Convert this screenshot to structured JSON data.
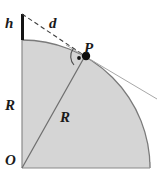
{
  "figure": {
    "background_color": "#ffffff",
    "shade_fill": "#d5d5d5",
    "shade_stroke": "#8c8c8c",
    "line_color": "#6b6b6b",
    "dash_color": "#4a4a4a",
    "accent_color": "#111111",
    "labels": {
      "height": "h",
      "tangent_distance": "d",
      "tangent_point": "P",
      "radius_vertical": "R",
      "radius_diagonal": "R",
      "origin": "O"
    },
    "geometry": {
      "origin_px": [
        22,
        168
      ],
      "radius_px": 128,
      "top_of_circle_px": [
        22,
        40
      ],
      "top_of_height_segment_px": [
        22,
        14
      ],
      "height_h_px": 26,
      "tangent_point_P_px": [
        85,
        56
      ],
      "arc_end_px": [
        150,
        168
      ],
      "tangent_line_end_px": [
        157,
        99
      ],
      "right_angle_marker": "arc-with-dot"
    }
  }
}
